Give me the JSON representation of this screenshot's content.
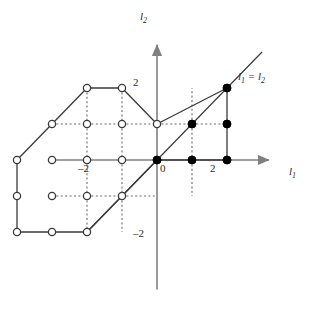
{
  "figure": {
    "type": "lattice-diagram",
    "background": "#ffffff",
    "axis_color": "#808080",
    "edge_color": "#3a3a3a",
    "dot_fill_color": "#000000",
    "dot_open_color": "#ffffff",
    "width": 314,
    "height": 324
  },
  "axes": {
    "x_label_main": "l",
    "x_label_sub": "1",
    "y_label_main": "l",
    "y_label_sub": "2",
    "origin_px": {
      "x": 157,
      "y": 160
    },
    "unit_px": {
      "x": 35,
      "y": 36
    },
    "x_range": [
      -3.1,
      3.2
    ],
    "y_range": [
      -3.6,
      3.2
    ],
    "arrows": [
      "x-positive",
      "y-positive"
    ]
  },
  "tick_labels": [
    {
      "text": "2",
      "axis": "y",
      "value": 2,
      "px": {
        "x": 140,
        "y": 82
      },
      "align": "right"
    },
    {
      "text": "–2",
      "axis": "y",
      "value": -2,
      "px": {
        "x": 142,
        "y": 233
      },
      "align": "right"
    },
    {
      "text": "–2",
      "axis": "x",
      "value": -2,
      "px": {
        "x": 80,
        "y": 166
      },
      "align": "left"
    },
    {
      "text": "0",
      "axis": "x",
      "value": 0,
      "px": {
        "x": 161,
        "y": 166
      },
      "align": "left"
    },
    {
      "text": "2",
      "axis": "x",
      "value": 2,
      "px": {
        "x": 211,
        "y": 166
      },
      "align": "left"
    }
  ],
  "annotations": [
    {
      "name": "diagonal-equation",
      "text_main_1": "l",
      "sub_1": "1",
      "eq": " = ",
      "text_main_2": "l",
      "sub_2": "2",
      "px": {
        "x": 238,
        "y": 75
      }
    }
  ],
  "chart_data": {
    "type": "scatter",
    "title": "",
    "xlabel": "l1",
    "ylabel": "l2",
    "xlim": [
      -3.1,
      3.2
    ],
    "ylim": [
      -3.6,
      3.2
    ],
    "grid": false,
    "legend": "none",
    "lattice_spacing": 1,
    "diagonal_line": {
      "label": "l1 = l2",
      "from": [
        -2,
        -2
      ],
      "to": [
        3.0,
        3.0
      ]
    },
    "filled_points": [
      [
        2,
        2
      ],
      [
        1,
        1
      ],
      [
        2,
        1
      ],
      [
        0,
        0
      ],
      [
        1,
        0
      ],
      [
        2,
        0
      ]
    ],
    "open_points": [
      [
        -2,
        2
      ],
      [
        -1,
        2
      ],
      [
        -3,
        1
      ],
      [
        -2,
        1
      ],
      [
        -1,
        1
      ],
      [
        0,
        1
      ],
      [
        -4,
        0
      ],
      [
        -3,
        0
      ],
      [
        -2,
        0
      ],
      [
        -1,
        0
      ],
      [
        -4,
        -1
      ],
      [
        -3,
        -1
      ],
      [
        -2,
        -1
      ],
      [
        -1,
        -1
      ],
      [
        -4,
        -2
      ],
      [
        -3,
        -2
      ],
      [
        -2,
        -2
      ]
    ],
    "solid_edges": [
      [
        [
          -2,
          2
        ],
        [
          -1,
          2
        ]
      ],
      [
        [
          -1,
          2
        ],
        [
          0,
          1
        ]
      ],
      [
        [
          -2,
          2
        ],
        [
          -3,
          1
        ]
      ],
      [
        [
          -3,
          1
        ],
        [
          -4,
          0
        ]
      ],
      [
        [
          -4,
          0
        ],
        [
          -4,
          -1
        ]
      ],
      [
        [
          -4,
          -1
        ],
        [
          -4,
          -2
        ]
      ],
      [
        [
          -4,
          -2
        ],
        [
          -3,
          -2
        ]
      ],
      [
        [
          -3,
          -2
        ],
        [
          -2,
          -2
        ]
      ],
      [
        [
          -2,
          -2
        ],
        [
          -1,
          -1
        ]
      ],
      [
        [
          -1,
          -1
        ],
        [
          0,
          0
        ]
      ],
      [
        [
          0,
          1
        ],
        [
          2,
          2
        ]
      ],
      [
        [
          2,
          2
        ],
        [
          2,
          1
        ]
      ],
      [
        [
          2,
          1
        ],
        [
          2,
          0
        ]
      ],
      [
        [
          2,
          0
        ],
        [
          0,
          0
        ]
      ]
    ],
    "dotted_edges": [
      [
        [
          -1,
          2
        ],
        [
          -1,
          1
        ]
      ],
      [
        [
          -1,
          1
        ],
        [
          -1,
          0
        ]
      ],
      [
        [
          -1,
          0
        ],
        [
          -1,
          -1
        ]
      ],
      [
        [
          -1,
          -1
        ],
        [
          -1,
          -2
        ]
      ],
      [
        [
          -3,
          1
        ],
        [
          -2,
          1
        ]
      ],
      [
        [
          -2,
          1
        ],
        [
          -1,
          1
        ]
      ],
      [
        [
          -1,
          1
        ],
        [
          0,
          1
        ]
      ],
      [
        [
          -3,
          -1
        ],
        [
          -2,
          -1
        ]
      ],
      [
        [
          -2,
          -1
        ],
        [
          -1,
          -1
        ]
      ],
      [
        [
          -1,
          -1
        ],
        [
          0,
          -1
        ]
      ],
      [
        [
          -2,
          2
        ],
        [
          -2,
          1
        ]
      ],
      [
        [
          -2,
          1
        ],
        [
          -2,
          0
        ]
      ],
      [
        [
          -2,
          0
        ],
        [
          -2,
          -1
        ]
      ],
      [
        [
          -2,
          -1
        ],
        [
          -2,
          -2
        ]
      ],
      [
        [
          1,
          1
        ],
        [
          1,
          2
        ]
      ],
      [
        [
          1,
          1
        ],
        [
          1,
          0
        ]
      ],
      [
        [
          1,
          0
        ],
        [
          1,
          -1
        ]
      ],
      [
        [
          0,
          1
        ],
        [
          1,
          1
        ]
      ],
      [
        [
          1,
          1
        ],
        [
          2,
          1
        ]
      ]
    ]
  }
}
